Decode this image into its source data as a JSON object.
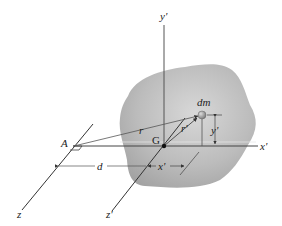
{
  "figure": {
    "labels": {
      "y_prime_axis": "y'",
      "x_prime_axis": "x'",
      "z_prime_axis": "z'",
      "z_axis": "z",
      "point_A": "A",
      "point_G": "G",
      "mass_element": "dm",
      "vector_r": "r",
      "vector_r_prime": "r'",
      "distance_d": "d",
      "dim_x_prime": "x'",
      "dim_y_prime": "y'"
    },
    "colors": {
      "body_fill": "#b5b5b5",
      "body_edge": "#9a9a9a",
      "line": "#333333",
      "dm_fill": "#8a8a8a"
    }
  }
}
